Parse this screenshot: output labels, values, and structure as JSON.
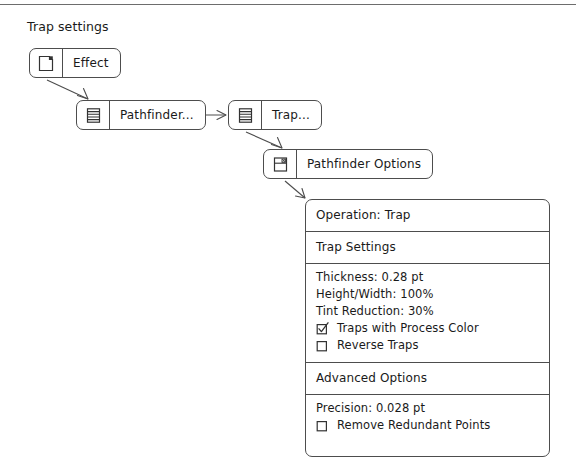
{
  "diagram": {
    "title": "Trap settings",
    "nodes": [
      {
        "id": "effect",
        "label": "Effect",
        "icon": "document-page-icon"
      },
      {
        "id": "pathfinder",
        "label": "Pathfinder...",
        "icon": "list-lines-icon"
      },
      {
        "id": "trap",
        "label": "Trap...",
        "icon": "list-lines-icon"
      },
      {
        "id": "options",
        "label": "Pathfinder Options",
        "icon": "dialog-window-icon"
      }
    ],
    "edges": [
      {
        "from": "effect",
        "to": "pathfinder",
        "style": "diagonal-arrow"
      },
      {
        "from": "pathfinder",
        "to": "trap",
        "style": "horizontal-arrow"
      },
      {
        "from": "trap",
        "to": "options",
        "style": "diagonal-arrow"
      },
      {
        "from": "options",
        "to": "panel",
        "style": "diagonal-arrow"
      }
    ]
  },
  "panel": {
    "operation": {
      "label": "Operation: Trap"
    },
    "trap_settings": {
      "heading": "Trap Settings",
      "fields": [
        "Thickness: 0.28 pt",
        "Height/Width: 100%",
        "Tint Reduction: 30%"
      ],
      "checkboxes": [
        {
          "label": "Traps with Process Color",
          "checked": true
        },
        {
          "label": "Reverse Traps",
          "checked": false
        }
      ]
    },
    "advanced_options": {
      "heading": "Advanced Options",
      "fields": [
        "Precision: 0.028 pt"
      ],
      "checkboxes": [
        {
          "label": "Remove Redundant Points",
          "checked": false
        }
      ]
    }
  },
  "colors": {
    "stroke": "#4d4d4d",
    "text": "#1a1a1a",
    "background": "#ffffff",
    "rule": "#6d6d6d"
  }
}
